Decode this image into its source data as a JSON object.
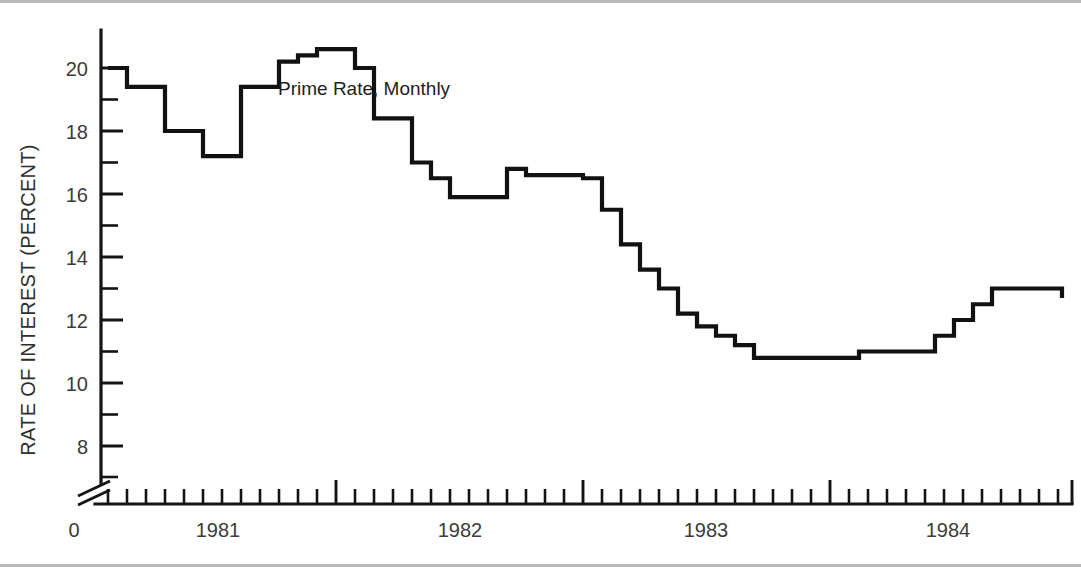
{
  "figure": {
    "background_color": "#ffffff",
    "line_color": "#111111",
    "axis_color": "#141414",
    "annotation": "Prime Rate, Monthly",
    "y_axis_title": "RATE OF INTEREST (PERCENT)",
    "origin_label": "0"
  },
  "chart_data": {
    "type": "line",
    "title": "Prime Rate, Monthly",
    "xlabel": "",
    "ylabel": "RATE OF INTEREST (PERCENT)",
    "style": "step-post",
    "grid": false,
    "legend": null,
    "axis_break": true,
    "ylim": [
      7,
      21.5
    ],
    "yticks_major": [
      8,
      10,
      12,
      14,
      16,
      18,
      20
    ],
    "yticks_minor": [
      9,
      11,
      13,
      15,
      17,
      19,
      21
    ],
    "ytick_labels": [
      "8",
      "10",
      "12",
      "14",
      "16",
      "18",
      "20"
    ],
    "xlim": [
      "1980-09",
      "1984-05"
    ],
    "xtick_labels": [
      "1981",
      "1982",
      "1983",
      "1984"
    ],
    "xtick_major_positions": [
      "1981-07",
      "1982-07",
      "1983-07",
      "1984-07"
    ],
    "x_minor_interval": "1 month",
    "x": [
      "1980-10",
      "1980-11",
      "1980-12",
      "1981-01",
      "1981-02",
      "1981-03",
      "1981-04",
      "1981-05",
      "1981-06",
      "1981-07",
      "1981-08",
      "1981-09",
      "1981-10",
      "1981-11",
      "1981-12",
      "1982-01",
      "1982-02",
      "1982-03",
      "1982-04",
      "1982-05",
      "1982-06",
      "1982-07",
      "1982-08",
      "1982-09",
      "1982-10",
      "1982-11",
      "1982-12",
      "1983-01",
      "1983-02",
      "1983-03",
      "1983-04",
      "1983-05",
      "1983-06",
      "1983-07",
      "1983-08",
      "1983-09",
      "1983-10",
      "1983-11",
      "1983-12",
      "1984-01",
      "1984-02",
      "1984-03",
      "1984-04",
      "1984-05"
    ],
    "values": [
      20.0,
      19.4,
      19.4,
      18.0,
      18.0,
      17.2,
      17.2,
      19.4,
      19.4,
      20.2,
      20.4,
      20.6,
      20.6,
      20.0,
      18.4,
      18.4,
      17.0,
      16.5,
      15.9,
      15.9,
      15.9,
      16.8,
      16.6,
      16.6,
      16.6,
      16.5,
      15.5,
      14.4,
      13.6,
      13.0,
      12.2,
      11.8,
      11.5,
      11.2,
      10.8,
      10.8,
      10.8,
      11.0,
      11.0,
      11.0,
      11.5,
      12.0,
      12.5,
      13.0
    ]
  },
  "series_points": [
    {
      "x": 108,
      "y": 20.0
    },
    {
      "x": 127,
      "y": 19.4
    },
    {
      "x": 146,
      "y": 19.4
    },
    {
      "x": 165,
      "y": 18.0
    },
    {
      "x": 184,
      "y": 18.0
    },
    {
      "x": 203,
      "y": 17.2
    },
    {
      "x": 222,
      "y": 17.2
    },
    {
      "x": 241,
      "y": 19.4
    },
    {
      "x": 260,
      "y": 19.4
    },
    {
      "x": 279,
      "y": 20.2
    },
    {
      "x": 298,
      "y": 20.4
    },
    {
      "x": 317,
      "y": 20.6
    },
    {
      "x": 336,
      "y": 20.6
    },
    {
      "x": 355,
      "y": 20.0
    },
    {
      "x": 374,
      "y": 18.4
    },
    {
      "x": 393,
      "y": 18.4
    },
    {
      "x": 412,
      "y": 17.0
    },
    {
      "x": 431,
      "y": 16.5
    },
    {
      "x": 450,
      "y": 15.9
    },
    {
      "x": 469,
      "y": 15.9
    },
    {
      "x": 488,
      "y": 15.9
    },
    {
      "x": 507,
      "y": 16.8
    },
    {
      "x": 526,
      "y": 16.6
    },
    {
      "x": 545,
      "y": 16.6
    },
    {
      "x": 564,
      "y": 16.6
    },
    {
      "x": 583,
      "y": 16.5
    },
    {
      "x": 602,
      "y": 15.5
    },
    {
      "x": 621,
      "y": 14.4
    },
    {
      "x": 640,
      "y": 13.6
    },
    {
      "x": 659,
      "y": 13.0
    },
    {
      "x": 678,
      "y": 12.2
    },
    {
      "x": 697,
      "y": 11.8
    },
    {
      "x": 716,
      "y": 11.5
    },
    {
      "x": 735,
      "y": 11.2
    },
    {
      "x": 754,
      "y": 10.8
    },
    {
      "x": 840,
      "y": 10.8
    },
    {
      "x": 859,
      "y": 11.0
    },
    {
      "x": 916,
      "y": 11.0
    },
    {
      "x": 935,
      "y": 11.5
    },
    {
      "x": 954,
      "y": 12.0
    },
    {
      "x": 973,
      "y": 12.5
    },
    {
      "x": 992,
      "y": 13.0
    },
    {
      "x": 1049,
      "y": 13.0
    },
    {
      "x": 1062,
      "y": 12.7
    }
  ]
}
